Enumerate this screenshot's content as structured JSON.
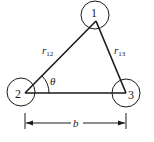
{
  "diagram": {
    "type": "three-body triangle geometry",
    "nodes": [
      {
        "id": "1",
        "label": "1",
        "cx": 95,
        "cy": 15,
        "r": 14,
        "vx": 96,
        "vy": 21
      },
      {
        "id": "2",
        "label": "2",
        "cx": 21,
        "cy": 92,
        "r": 14,
        "vx": 25,
        "vy": 93
      },
      {
        "id": "3",
        "label": "3",
        "cx": 126,
        "cy": 93,
        "r": 14,
        "vx": 126,
        "vy": 93
      }
    ],
    "edges": [
      {
        "from": "2",
        "to": "1",
        "label": "r",
        "subscript": "12"
      },
      {
        "from": "1",
        "to": "3",
        "label": "r",
        "subscript": "13"
      },
      {
        "from": "2",
        "to": "3",
        "label": ""
      }
    ],
    "angle": {
      "at": "2",
      "label": "θ"
    },
    "dimension": {
      "label": "b",
      "from": "2",
      "to": "3"
    },
    "colors": {
      "line": "#1a1a1a",
      "background": "#ffffff"
    }
  }
}
